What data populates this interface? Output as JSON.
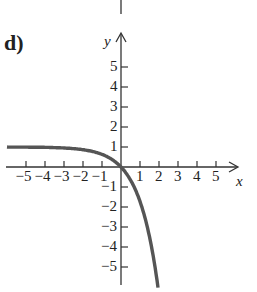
{
  "panel_label": "d)",
  "chart_data": {
    "type": "line",
    "title": "",
    "xlabel": "x",
    "ylabel": "y",
    "function": "y = 1 - e^x",
    "xlim": [
      -5.5,
      5.5
    ],
    "ylim": [
      -6,
      6
    ],
    "x_ticks": [
      -5,
      -4,
      -3,
      -2,
      -1,
      1,
      2,
      3,
      4,
      5
    ],
    "y_ticks": [
      -5,
      -4,
      -3,
      -2,
      -1,
      1,
      2,
      3,
      4,
      5
    ],
    "grid": false,
    "series": [
      {
        "name": "curve",
        "color": "#555555",
        "x": [
          -5.6,
          -5,
          -4,
          -3,
          -2,
          -1,
          -0.5,
          0,
          0.5,
          1,
          1.25,
          1.5,
          1.75,
          1.95
        ],
        "y": [
          0.996,
          0.993,
          0.982,
          0.95,
          0.865,
          0.632,
          0.393,
          0,
          -0.649,
          -1.718,
          -2.49,
          -3.48,
          -4.75,
          -6.03
        ]
      }
    ],
    "asymptote": {
      "y": 1,
      "side": "left"
    }
  },
  "colors": {
    "axis": "#333333",
    "curve": "#555555",
    "text": "#222222"
  }
}
